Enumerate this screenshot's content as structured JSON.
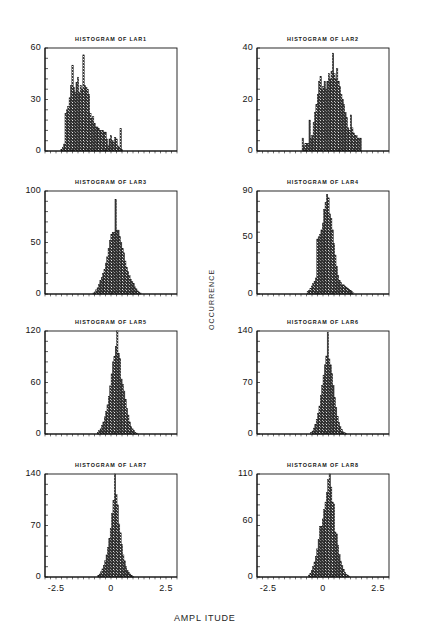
{
  "figure": {
    "width": 432,
    "height": 643,
    "background": "#ffffff",
    "ink": "#141414",
    "axis_x_title": "AMPL ITUDE",
    "axis_y_title": "OCCURRENCE",
    "caption": "",
    "x_ticks": [
      "-2.5",
      "0",
      "2.5"
    ],
    "xlim": [
      -3.0,
      3.0
    ],
    "bar_fill_pattern": "cross-hatch-checker"
  },
  "chart_data": [
    {
      "type": "bar",
      "title": "HISTOGRAM OF LAR1",
      "xlabel": "AMPL ITUDE",
      "ylabel": "OCCURRENCE",
      "ylim": [
        0,
        60
      ],
      "xlim": [
        -3.0,
        3.0
      ],
      "yticks": [
        0,
        30,
        60
      ],
      "ytick_labels": [
        "0",
        "30",
        "60"
      ],
      "xticks": [
        -2.5,
        0,
        2.5
      ],
      "xtick_labels": [
        "-2.5",
        "0",
        "2.5"
      ],
      "grid": false,
      "legend": "none",
      "bin_width": 0.0625,
      "bin_start": -2.28,
      "values": [
        1,
        2,
        4,
        22,
        24,
        26,
        31,
        38,
        50,
        37,
        34,
        40,
        43,
        34,
        38,
        36,
        56,
        38,
        37,
        36,
        33,
        22,
        19,
        20,
        16,
        14,
        14,
        13,
        12,
        12,
        12,
        11,
        11,
        7,
        3,
        7,
        9,
        6,
        5,
        8,
        7,
        3,
        2,
        13,
        1,
        0,
        0,
        0
      ]
    },
    {
      "type": "bar",
      "title": "HISTOGRAM OF LAR2",
      "xlabel": "AMPL ITUDE",
      "ylabel": "OCCURRENCE",
      "ylim": [
        0,
        40
      ],
      "xlim": [
        -3.0,
        3.0
      ],
      "yticks": [
        0,
        20,
        40
      ],
      "ytick_labels": [
        "0",
        "20",
        "40"
      ],
      "xticks": [
        -2.5,
        0,
        2.5
      ],
      "xtick_labels": [
        "-2.5",
        "0",
        "2.5"
      ],
      "grid": false,
      "legend": "none",
      "bin_width": 0.0625,
      "bin_start": -0.95,
      "values": [
        5,
        2,
        3,
        3,
        3,
        12,
        5,
        6,
        11,
        15,
        18,
        22,
        27,
        29,
        24,
        25,
        27,
        24,
        27,
        30,
        28,
        31,
        38,
        30,
        28,
        32,
        27,
        25,
        22,
        20,
        18,
        15,
        13,
        9,
        8,
        14,
        9,
        7,
        6,
        6,
        5,
        5,
        5
      ]
    },
    {
      "type": "bar",
      "title": "HISTOGRAM OF LAR3",
      "xlabel": "AMPL ITUDE",
      "ylabel": "OCCURRENCE",
      "ylim": [
        0,
        100
      ],
      "xlim": [
        -3.0,
        3.0
      ],
      "yticks": [
        0,
        50,
        100
      ],
      "ytick_labels": [
        "0",
        "50",
        "100"
      ],
      "xticks": [
        -2.5,
        0,
        2.5
      ],
      "xtick_labels": [
        "-2.5",
        "0",
        "2.5"
      ],
      "grid": false,
      "legend": "none",
      "bin_width": 0.0625,
      "bin_start": -0.82,
      "values": [
        1,
        2,
        4,
        6,
        9,
        13,
        16,
        20,
        24,
        30,
        36,
        44,
        52,
        58,
        60,
        60,
        92,
        62,
        62,
        56,
        50,
        44,
        40,
        32,
        26,
        22,
        18,
        14,
        12,
        10,
        7,
        5,
        3,
        2,
        1
      ]
    },
    {
      "type": "bar",
      "title": "HISTOGRAM OF LAR4",
      "xlabel": "AMPL ITUDE",
      "ylabel": "OCCURRENCE",
      "ylim": [
        0,
        90
      ],
      "xlim": [
        -3.0,
        3.0
      ],
      "yticks": [
        0,
        50,
        90
      ],
      "ytick_labels": [
        "0",
        "50",
        "90"
      ],
      "xticks": [
        -2.5,
        0,
        2.5
      ],
      "xtick_labels": [
        "-2.5",
        "0",
        "2.5"
      ],
      "grid": false,
      "legend": "none",
      "bin_width": 0.0625,
      "bin_start": -0.72,
      "values": [
        2,
        3,
        5,
        7,
        9,
        11,
        14,
        48,
        50,
        52,
        56,
        62,
        74,
        80,
        87,
        84,
        70,
        66,
        56,
        44,
        34,
        24,
        16,
        12,
        10,
        8,
        8,
        7,
        6,
        5,
        4,
        3,
        2,
        1
      ]
    },
    {
      "type": "bar",
      "title": "HISTOGRAM OF LAR5",
      "xlabel": "AMPL ITUDE",
      "ylabel": "OCCURRENCE",
      "ylim": [
        0,
        120
      ],
      "xlim": [
        -3.0,
        3.0
      ],
      "yticks": [
        0,
        60,
        120
      ],
      "ytick_labels": [
        "0",
        "60",
        "120"
      ],
      "xticks": [
        -2.5,
        0,
        2.5
      ],
      "xtick_labels": [
        "-2.5",
        "0",
        "2.5"
      ],
      "grid": false,
      "legend": "none",
      "bin_width": 0.0625,
      "bin_start": -0.62,
      "values": [
        2,
        4,
        6,
        10,
        14,
        20,
        26,
        34,
        44,
        56,
        70,
        84,
        90,
        102,
        120,
        94,
        88,
        64,
        58,
        50,
        40,
        30,
        22,
        14,
        9,
        6,
        4,
        2,
        1
      ]
    },
    {
      "type": "bar",
      "title": "HISTOGRAM OF LAR6",
      "xlabel": "AMPL ITUDE",
      "ylabel": "OCCURRENCE",
      "ylim": [
        0,
        140
      ],
      "xlim": [
        -3.0,
        3.0
      ],
      "yticks": [
        0,
        70,
        140
      ],
      "ytick_labels": [
        "0",
        "70",
        "140"
      ],
      "xticks": [
        -2.5,
        0,
        2.5
      ],
      "xtick_labels": [
        "-2.5",
        "0",
        "2.5"
      ],
      "grid": false,
      "legend": "none",
      "bin_width": 0.0625,
      "bin_start": -0.56,
      "values": [
        2,
        4,
        8,
        13,
        20,
        28,
        38,
        52,
        66,
        80,
        94,
        106,
        138,
        102,
        94,
        82,
        66,
        50,
        36,
        24,
        16,
        10,
        6,
        3,
        2,
        1
      ]
    },
    {
      "type": "bar",
      "title": "HISTOGRAM OF LAR7",
      "xlabel": "AMPL ITUDE",
      "ylabel": "OCCURRENCE",
      "ylim": [
        0,
        140
      ],
      "xlim": [
        -3.0,
        3.0
      ],
      "yticks": [
        0,
        70,
        140
      ],
      "ytick_labels": [
        "0",
        "70",
        "140"
      ],
      "xticks": [
        -2.5,
        0,
        2.5
      ],
      "xtick_labels": [
        "-2.5",
        "0",
        "2.5"
      ],
      "grid": false,
      "legend": "none",
      "bin_width": 0.0625,
      "bin_start": -0.6,
      "values": [
        2,
        4,
        7,
        11,
        16,
        22,
        30,
        40,
        52,
        66,
        86,
        104,
        140,
        112,
        98,
        72,
        60,
        44,
        30,
        22,
        14,
        9,
        6,
        4,
        2,
        1
      ]
    },
    {
      "type": "bar",
      "title": "HISTOGRAM OF LAR8",
      "xlabel": "AMPL ITUDE",
      "ylabel": "OCCURRENCE",
      "ylim": [
        0,
        110
      ],
      "xlim": [
        -3.0,
        3.0
      ],
      "yticks": [
        0,
        60,
        110
      ],
      "ytick_labels": [
        "0",
        "60",
        "110"
      ],
      "xticks": [
        -2.5,
        0,
        2.5
      ],
      "xtick_labels": [
        "-2.5",
        "0",
        "2.5"
      ],
      "grid": false,
      "legend": "none",
      "bin_width": 0.0625,
      "bin_start": -0.66,
      "values": [
        2,
        4,
        7,
        11,
        16,
        22,
        30,
        40,
        54,
        54,
        62,
        72,
        80,
        90,
        104,
        110,
        96,
        80,
        78,
        48,
        46,
        34,
        24,
        17,
        12,
        8,
        5,
        3,
        2,
        1
      ]
    }
  ]
}
